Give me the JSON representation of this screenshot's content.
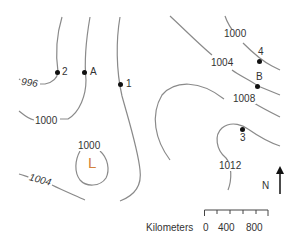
{
  "map": {
    "isobar_unit": "mb",
    "isobar_labels": [
      "996",
      "1000",
      "1000",
      "1000",
      "1004",
      "1004",
      "1008",
      "1012"
    ],
    "stations": [
      {
        "id": "2",
        "label": "2"
      },
      {
        "id": "A",
        "label": "A"
      },
      {
        "id": "1",
        "label": "1"
      },
      {
        "id": "4",
        "label": "4"
      },
      {
        "id": "B",
        "label": "B"
      },
      {
        "id": "3",
        "label": "3"
      }
    ],
    "low_pressure": {
      "symbol": "L",
      "color": "#d4823c"
    },
    "north_arrow": {
      "label": "N"
    },
    "scale": {
      "title": "Kilometers",
      "ticks": [
        "0",
        "400",
        "800"
      ]
    },
    "colors": {
      "isobar": "#8a8a8a",
      "text": "#333333",
      "dot": "#111111"
    }
  }
}
